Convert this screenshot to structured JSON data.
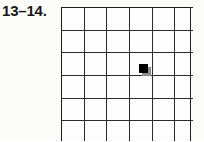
{
  "figure": {
    "label": "13–14.",
    "kind": "blank-grid-worksheet"
  },
  "colors": {
    "background": "#fcfcfb",
    "grid_line": "#2b2b2b",
    "frame_line": "#1e1e1e",
    "marker_fill": "#000000",
    "marker_shadow": "#8d8d8d",
    "label_text": "#171717"
  },
  "grid": {
    "columns": 6,
    "rows": 7,
    "visible_rows": 6.25,
    "cell_size_px": 21.7,
    "line_width_px": 2,
    "origin_x_px": 61,
    "origin_y_px": 7,
    "clipped_at_bottom": true,
    "cell_labels": [
      [
        "",
        "",
        "",
        "",
        "",
        ""
      ],
      [
        "",
        "",
        "",
        "",
        "",
        ""
      ],
      [
        "",
        "",
        "",
        "",
        "",
        ""
      ],
      [
        "",
        "",
        "",
        "",
        "",
        ""
      ],
      [
        "",
        "",
        "",
        "",
        "",
        ""
      ],
      [
        "",
        "",
        "",
        "",
        "",
        ""
      ],
      [
        "",
        "",
        "",
        "",
        "",
        ""
      ]
    ]
  },
  "marker": {
    "name": "filled-square-marker",
    "shape": "square",
    "column": 4,
    "row": 3,
    "anchor": "top-left-corner-of-cell",
    "size_px": 9,
    "left_px": 139,
    "top_px": 64,
    "shadow_offset_px": 3
  }
}
